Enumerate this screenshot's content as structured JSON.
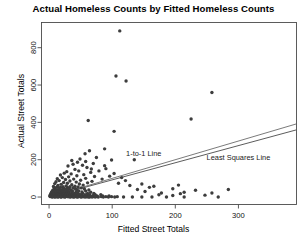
{
  "chart_data": {
    "type": "scatter",
    "title": "Actual Homeless Counts by Fitted Homeless Counts",
    "xlabel": "Fitted Street Totals",
    "ylabel": "Actual Street Totals",
    "xlim": [
      -12,
      392
    ],
    "ylim": [
      -40,
      935
    ],
    "xticks": [
      0,
      100,
      200,
      300
    ],
    "yticks": [
      0,
      200,
      400,
      600,
      800
    ],
    "xtick_labels": [
      "0",
      "100",
      "200",
      "300"
    ],
    "ytick_labels": [
      "0",
      "200",
      "400",
      "600",
      "800"
    ],
    "grid": false,
    "legend": "none",
    "marker": {
      "shape": "circle",
      "size": 1.7,
      "color": "#3d3d3d"
    },
    "annotations": [
      {
        "text": "1-to-1 Line",
        "x": 150,
        "y": 218
      },
      {
        "text": "Least Squares Line",
        "x": 300,
        "y": 200
      }
    ],
    "lines": [
      {
        "name": "1-to-1 Line",
        "color": "#6b6b6b",
        "width": 0.9,
        "x": [
          0,
          392
        ],
        "y": [
          0,
          392
        ]
      },
      {
        "name": "Least Squares Line",
        "color": "#4a4a4a",
        "width": 0.9,
        "x": [
          0,
          392
        ],
        "y": [
          0,
          360
        ]
      }
    ],
    "points": [
      [
        112,
        890
      ],
      [
        106,
        648
      ],
      [
        122,
        622
      ],
      [
        258,
        560
      ],
      [
        225,
        418
      ],
      [
        62,
        410
      ],
      [
        103,
        352
      ],
      [
        88,
        258
      ],
      [
        64,
        248
      ],
      [
        57,
        232
      ],
      [
        75,
        212
      ],
      [
        135,
        200
      ],
      [
        99,
        198
      ],
      [
        45,
        186
      ],
      [
        70,
        180
      ],
      [
        38,
        176
      ],
      [
        53,
        170
      ],
      [
        30,
        166
      ],
      [
        60,
        158
      ],
      [
        90,
        152
      ],
      [
        41,
        148
      ],
      [
        47,
        140
      ],
      [
        28,
        136
      ],
      [
        66,
        132
      ],
      [
        24,
        128
      ],
      [
        35,
        124
      ],
      [
        55,
        120
      ],
      [
        18,
        118
      ],
      [
        44,
        114
      ],
      [
        72,
        110
      ],
      [
        31,
        108
      ],
      [
        21,
        104
      ],
      [
        58,
        100
      ],
      [
        13,
        98
      ],
      [
        39,
        96
      ],
      [
        26,
        94
      ],
      [
        50,
        90
      ],
      [
        16,
        88
      ],
      [
        33,
        86
      ],
      [
        68,
        84
      ],
      [
        11,
        82
      ],
      [
        43,
        80
      ],
      [
        23,
        78
      ],
      [
        61,
        76
      ],
      [
        29,
        74
      ],
      [
        9,
        72
      ],
      [
        48,
        70
      ],
      [
        19,
        68
      ],
      [
        36,
        66
      ],
      [
        54,
        64
      ],
      [
        14,
        62
      ],
      [
        27,
        60
      ],
      [
        41,
        58
      ],
      [
        7,
        57
      ],
      [
        22,
        56
      ],
      [
        33,
        55
      ],
      [
        46,
        54
      ],
      [
        12,
        53
      ],
      [
        18,
        52
      ],
      [
        29,
        51
      ],
      [
        38,
        50
      ],
      [
        51,
        49
      ],
      [
        8,
        48
      ],
      [
        16,
        47
      ],
      [
        24,
        46
      ],
      [
        31,
        45
      ],
      [
        42,
        44
      ],
      [
        56,
        43
      ],
      [
        10,
        42
      ],
      [
        15,
        41
      ],
      [
        21,
        40
      ],
      [
        27,
        40
      ],
      [
        34,
        39
      ],
      [
        44,
        38
      ],
      [
        63,
        38
      ],
      [
        6,
        37
      ],
      [
        11,
        36
      ],
      [
        17,
        36
      ],
      [
        23,
        35
      ],
      [
        29,
        34
      ],
      [
        36,
        34
      ],
      [
        47,
        33
      ],
      [
        58,
        32
      ],
      [
        5,
        31
      ],
      [
        9,
        31
      ],
      [
        13,
        30
      ],
      [
        18,
        30
      ],
      [
        22,
        29
      ],
      [
        26,
        29
      ],
      [
        31,
        28
      ],
      [
        37,
        28
      ],
      [
        43,
        27
      ],
      [
        52,
        27
      ],
      [
        66,
        26
      ],
      [
        4,
        26
      ],
      [
        7,
        25
      ],
      [
        10,
        25
      ],
      [
        14,
        24
      ],
      [
        17,
        24
      ],
      [
        20,
        23
      ],
      [
        24,
        23
      ],
      [
        28,
        22
      ],
      [
        32,
        22
      ],
      [
        36,
        21
      ],
      [
        41,
        21
      ],
      [
        46,
        20
      ],
      [
        53,
        20
      ],
      [
        61,
        19
      ],
      [
        71,
        19
      ],
      [
        3,
        19
      ],
      [
        6,
        18
      ],
      [
        8,
        18
      ],
      [
        11,
        18
      ],
      [
        13,
        17
      ],
      [
        16,
        17
      ],
      [
        19,
        17
      ],
      [
        22,
        16
      ],
      [
        25,
        16
      ],
      [
        28,
        16
      ],
      [
        31,
        15
      ],
      [
        34,
        15
      ],
      [
        38,
        15
      ],
      [
        42,
        14
      ],
      [
        47,
        14
      ],
      [
        51,
        14
      ],
      [
        57,
        13
      ],
      [
        64,
        13
      ],
      [
        73,
        13
      ],
      [
        82,
        12
      ],
      [
        2,
        12
      ],
      [
        4,
        12
      ],
      [
        6,
        12
      ],
      [
        8,
        11
      ],
      [
        10,
        11
      ],
      [
        12,
        11
      ],
      [
        14,
        11
      ],
      [
        16,
        10
      ],
      [
        18,
        10
      ],
      [
        20,
        10
      ],
      [
        23,
        10
      ],
      [
        25,
        9
      ],
      [
        27,
        9
      ],
      [
        30,
        9
      ],
      [
        33,
        9
      ],
      [
        36,
        8
      ],
      [
        39,
        8
      ],
      [
        42,
        8
      ],
      [
        45,
        8
      ],
      [
        49,
        8
      ],
      [
        53,
        7
      ],
      [
        58,
        7
      ],
      [
        63,
        7
      ],
      [
        69,
        7
      ],
      [
        76,
        6
      ],
      [
        85,
        6
      ],
      [
        95,
        6
      ],
      [
        1,
        6
      ],
      [
        3,
        6
      ],
      [
        5,
        5
      ],
      [
        7,
        5
      ],
      [
        9,
        5
      ],
      [
        11,
        5
      ],
      [
        13,
        5
      ],
      [
        15,
        5
      ],
      [
        17,
        4
      ],
      [
        19,
        4
      ],
      [
        21,
        4
      ],
      [
        24,
        4
      ],
      [
        26,
        4
      ],
      [
        29,
        4
      ],
      [
        32,
        4
      ],
      [
        35,
        3
      ],
      [
        38,
        3
      ],
      [
        41,
        3
      ],
      [
        44,
        3
      ],
      [
        48,
        3
      ],
      [
        52,
        3
      ],
      [
        56,
        3
      ],
      [
        60,
        3
      ],
      [
        65,
        2
      ],
      [
        70,
        2
      ],
      [
        76,
        2
      ],
      [
        83,
        2
      ],
      [
        90,
        2
      ],
      [
        99,
        2
      ],
      [
        108,
        2
      ],
      [
        2,
        2
      ],
      [
        4,
        2
      ],
      [
        6,
        2
      ],
      [
        8,
        2
      ],
      [
        10,
        1
      ],
      [
        12,
        1
      ],
      [
        15,
        1
      ],
      [
        18,
        1
      ],
      [
        20,
        1
      ],
      [
        23,
        1
      ],
      [
        26,
        1
      ],
      [
        30,
        1
      ],
      [
        34,
        1
      ],
      [
        37,
        1
      ],
      [
        40,
        1
      ],
      [
        43,
        1
      ],
      [
        46,
        1
      ],
      [
        50,
        1
      ],
      [
        54,
        1
      ],
      [
        59,
        1
      ],
      [
        64,
        0
      ],
      [
        68,
        0
      ],
      [
        73,
        0
      ],
      [
        78,
        0
      ],
      [
        86,
        0
      ],
      [
        94,
        0
      ],
      [
        104,
        0
      ],
      [
        118,
        0
      ],
      [
        132,
        0
      ],
      [
        147,
        0
      ],
      [
        163,
        0
      ],
      [
        186,
        0
      ],
      [
        214,
        0
      ],
      [
        268,
        0
      ],
      [
        5,
        0
      ],
      [
        9,
        0
      ],
      [
        14,
        0
      ],
      [
        19,
        0
      ],
      [
        25,
        0
      ],
      [
        33,
        0
      ],
      [
        39,
        0
      ],
      [
        45,
        0
      ],
      [
        51,
        0
      ],
      [
        57,
        0
      ],
      [
        62,
        0
      ],
      [
        128,
        62
      ],
      [
        140,
        40
      ],
      [
        152,
        30
      ],
      [
        166,
        58
      ],
      [
        178,
        22
      ],
      [
        196,
        44
      ],
      [
        208,
        18
      ],
      [
        232,
        36
      ],
      [
        247,
        10
      ],
      [
        284,
        40
      ],
      [
        196,
        8
      ],
      [
        214,
        26
      ],
      [
        174,
        12
      ],
      [
        96,
        112
      ],
      [
        84,
        96
      ],
      [
        110,
        74
      ],
      [
        121,
        88
      ],
      [
        79,
        140
      ],
      [
        67,
        150
      ],
      [
        88,
        168
      ],
      [
        58,
        190
      ],
      [
        103,
        126
      ],
      [
        115,
        104
      ],
      [
        49,
        204
      ],
      [
        36,
        196
      ],
      [
        147,
        70
      ],
      [
        159,
        52
      ],
      [
        205,
        64
      ],
      [
        258,
        22
      ]
    ]
  }
}
